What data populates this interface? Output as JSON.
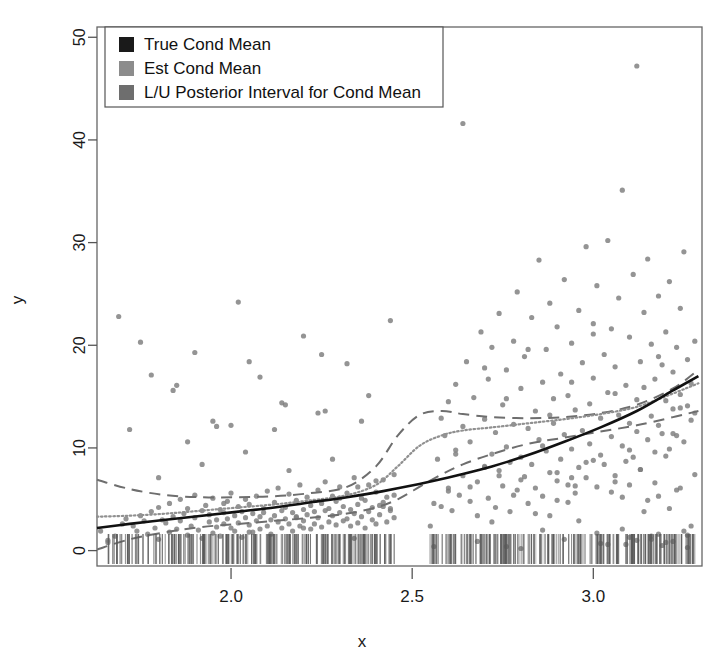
{
  "chart_data": {
    "type": "scatter",
    "title": "",
    "xlabel": "x",
    "ylabel": "y",
    "xlim": [
      1.63,
      3.3
    ],
    "ylim": [
      -1.5,
      51.0
    ],
    "grid": false,
    "xticks": [
      2.0,
      2.5,
      3.0
    ],
    "xticklabels": [
      "2.0",
      "2.5",
      "3.0"
    ],
    "yticks": [
      0,
      10,
      20,
      30,
      40,
      50
    ],
    "yticklabels": [
      "0",
      "10",
      "20",
      "30",
      "40",
      "50"
    ],
    "legend": {
      "position": "top-left",
      "entries": [
        {
          "label": "True Cond Mean",
          "color": "#1a1a1a",
          "marker": "square",
          "style": "solid"
        },
        {
          "label": "Est Cond Mean",
          "color": "#8c8c8c",
          "marker": "square",
          "style": "dotted"
        },
        {
          "label": "L/U Posterior Interval for Cond Mean",
          "color": "#6e6e6e",
          "marker": "square",
          "style": "dashed"
        }
      ]
    },
    "series": [
      {
        "name": "True Cond Mean",
        "type": "line",
        "style": "solid",
        "color": "#111111",
        "width": 2.6,
        "x": [
          1.63,
          1.72,
          1.82,
          1.92,
          2.02,
          2.12,
          2.22,
          2.32,
          2.42,
          2.52,
          2.62,
          2.72,
          2.82,
          2.92,
          3.02,
          3.12,
          3.22,
          3.29
        ],
        "y": [
          2.2,
          2.6,
          3.0,
          3.4,
          3.8,
          4.2,
          4.7,
          5.2,
          5.8,
          6.5,
          7.3,
          8.2,
          9.3,
          10.6,
          12.0,
          13.6,
          15.6,
          17.0
        ]
      },
      {
        "name": "Est Cond Mean",
        "type": "line",
        "style": "dotted",
        "color": "#909090",
        "width": 2.2,
        "x": [
          1.63,
          1.72,
          1.82,
          1.92,
          2.02,
          2.12,
          2.22,
          2.32,
          2.4,
          2.46,
          2.52,
          2.58,
          2.64,
          2.72,
          2.82,
          2.92,
          3.02,
          3.12,
          3.22,
          3.29
        ],
        "y": [
          3.3,
          3.4,
          3.6,
          3.9,
          4.2,
          4.5,
          4.9,
          5.4,
          6.4,
          8.2,
          10.2,
          11.2,
          11.7,
          12.0,
          12.4,
          12.8,
          13.3,
          14.0,
          15.3,
          16.3
        ]
      },
      {
        "name": "Upper Posterior Interval",
        "type": "line",
        "style": "dashed",
        "color": "#6e6e6e",
        "width": 2.0,
        "x": [
          1.63,
          1.72,
          1.82,
          1.92,
          2.02,
          2.12,
          2.22,
          2.32,
          2.4,
          2.46,
          2.52,
          2.58,
          2.64,
          2.72,
          2.82,
          2.92,
          3.02,
          3.12,
          3.22,
          3.29
        ],
        "y": [
          6.9,
          6.0,
          5.4,
          5.2,
          5.2,
          5.3,
          5.6,
          6.2,
          8.2,
          11.2,
          13.2,
          13.6,
          13.3,
          13.0,
          12.9,
          13.0,
          13.4,
          14.2,
          15.8,
          17.6
        ]
      },
      {
        "name": "Lower Posterior Interval",
        "type": "line",
        "style": "dashed",
        "color": "#6e6e6e",
        "width": 2.0,
        "x": [
          1.63,
          1.72,
          1.82,
          1.92,
          2.02,
          2.12,
          2.22,
          2.32,
          2.4,
          2.46,
          2.52,
          2.58,
          2.64,
          2.72,
          2.82,
          2.92,
          3.02,
          3.12,
          3.22,
          3.29
        ],
        "y": [
          0.1,
          1.1,
          1.8,
          2.3,
          2.6,
          2.9,
          3.2,
          3.6,
          4.2,
          5.0,
          6.2,
          7.4,
          8.4,
          9.4,
          10.4,
          11.0,
          11.6,
          12.2,
          13.0,
          13.6
        ]
      }
    ],
    "points": {
      "name": "observations",
      "marker": "circle",
      "color": "#7d7d7d",
      "size": 5,
      "n": 420,
      "x": [
        1.64,
        1.66,
        1.68,
        1.7,
        1.71,
        1.73,
        1.74,
        1.75,
        1.76,
        1.77,
        1.78,
        1.79,
        1.8,
        1.8,
        1.81,
        1.82,
        1.83,
        1.83,
        1.84,
        1.85,
        1.86,
        1.86,
        1.87,
        1.88,
        1.88,
        1.89,
        1.9,
        1.9,
        1.91,
        1.92,
        1.92,
        1.93,
        1.94,
        1.94,
        1.95,
        1.95,
        1.96,
        1.96,
        1.97,
        1.97,
        1.98,
        1.98,
        1.99,
        1.99,
        2.0,
        2.0,
        2.01,
        2.01,
        2.02,
        2.02,
        2.03,
        2.03,
        2.04,
        2.04,
        2.05,
        2.05,
        2.06,
        2.06,
        2.07,
        2.07,
        2.08,
        2.08,
        2.09,
        2.09,
        2.1,
        2.1,
        2.11,
        2.11,
        2.12,
        2.12,
        2.13,
        2.13,
        2.14,
        2.14,
        2.15,
        2.15,
        2.16,
        2.16,
        2.17,
        2.17,
        2.18,
        2.18,
        2.19,
        2.19,
        2.2,
        2.2,
        2.21,
        2.21,
        2.22,
        2.22,
        2.23,
        2.23,
        2.24,
        2.24,
        2.25,
        2.25,
        2.26,
        2.26,
        2.27,
        2.27,
        2.28,
        2.28,
        2.29,
        2.29,
        2.3,
        2.3,
        2.31,
        2.31,
        2.32,
        2.32,
        2.33,
        2.33,
        2.34,
        2.34,
        2.35,
        2.35,
        2.36,
        2.36,
        2.37,
        2.37,
        2.38,
        2.38,
        2.39,
        2.39,
        2.4,
        2.4,
        2.41,
        2.41,
        2.42,
        2.42,
        2.43,
        2.43,
        2.44,
        2.44,
        2.45,
        2.45,
        2.55,
        2.56,
        2.57,
        2.58,
        2.59,
        2.6,
        2.6,
        2.61,
        2.62,
        2.62,
        2.63,
        2.64,
        2.64,
        2.65,
        2.66,
        2.66,
        2.67,
        2.68,
        2.68,
        2.69,
        2.7,
        2.7,
        2.71,
        2.71,
        2.72,
        2.72,
        2.73,
        2.73,
        2.74,
        2.74,
        2.75,
        2.75,
        2.76,
        2.76,
        2.77,
        2.77,
        2.78,
        2.78,
        2.79,
        2.79,
        2.8,
        2.8,
        2.81,
        2.81,
        2.82,
        2.82,
        2.83,
        2.83,
        2.84,
        2.84,
        2.85,
        2.85,
        2.86,
        2.86,
        2.87,
        2.87,
        2.88,
        2.88,
        2.89,
        2.89,
        2.9,
        2.9,
        2.91,
        2.91,
        2.92,
        2.92,
        2.93,
        2.93,
        2.94,
        2.94,
        2.95,
        2.95,
        2.96,
        2.96,
        2.97,
        2.97,
        2.98,
        2.98,
        2.99,
        2.99,
        3.0,
        3.0,
        3.01,
        3.01,
        3.02,
        3.02,
        3.03,
        3.03,
        3.04,
        3.04,
        3.05,
        3.05,
        3.06,
        3.06,
        3.07,
        3.07,
        3.08,
        3.08,
        3.09,
        3.09,
        3.1,
        3.1,
        3.11,
        3.11,
        3.12,
        3.12,
        3.13,
        3.13,
        3.14,
        3.14,
        3.15,
        3.15,
        3.16,
        3.16,
        3.17,
        3.17,
        3.18,
        3.18,
        3.19,
        3.19,
        3.2,
        3.2,
        3.21,
        3.21,
        3.22,
        3.22,
        3.23,
        3.23,
        3.24,
        3.24,
        3.25,
        3.25,
        3.26,
        3.26,
        3.27,
        3.27,
        3.28,
        3.28,
        1.69,
        1.72,
        1.78,
        1.84,
        1.9,
        1.96,
        2.02,
        2.08,
        2.14,
        2.2,
        2.26,
        2.32,
        2.38,
        2.44,
        2.58,
        2.64,
        2.7,
        2.76,
        2.82,
        2.88,
        2.94,
        3.0,
        3.06,
        3.12,
        3.18,
        3.24,
        1.75,
        1.85,
        1.95,
        2.05,
        2.15,
        2.25,
        2.35,
        2.45,
        2.6,
        2.7,
        2.8,
        2.9,
        3.0,
        3.1,
        3.2,
        1.8,
        1.92,
        2.04,
        2.16,
        2.28,
        2.4,
        2.62,
        2.74,
        2.86,
        2.98,
        3.1,
        3.22,
        1.88,
        2.0,
        2.12,
        2.24,
        2.36,
        2.56,
        2.68,
        2.8,
        2.92,
        3.04,
        3.16,
        3.26,
        1.66,
        1.98,
        2.18,
        2.3,
        2.42,
        2.66,
        2.78,
        2.94,
        3.08,
        3.18,
        3.27,
        2.05,
        2.2,
        2.34,
        2.72,
        2.84,
        2.96,
        3.14,
        3.21,
        2.88,
        3.02,
        3.1,
        3.19,
        3.25,
        2.76,
        2.9,
        3.05,
        3.15,
        2.95,
        3.08,
        3.17,
        3.23,
        2.86,
        3.12,
        3.2,
        3.26,
        3.09,
        3.13,
        3.24,
        3.28,
        3.06,
        3.18,
        2.93,
        3.01,
        3.16,
        3.22
      ],
      "y": [
        1.9,
        1.0,
        1.4,
        2.6,
        3.1,
        2.4,
        1.9,
        3.4,
        2.9,
        1.6,
        3.8,
        2.2,
        4.2,
        1.1,
        3.0,
        2.7,
        4.6,
        1.8,
        3.3,
        2.1,
        5.0,
        2.9,
        3.6,
        1.5,
        4.1,
        2.4,
        3.2,
        5.4,
        2.0,
        3.9,
        1.2,
        4.4,
        2.8,
        3.5,
        1.7,
        5.1,
        3.0,
        2.3,
        4.0,
        1.4,
        3.7,
        2.6,
        4.8,
        3.1,
        2.2,
        5.6,
        3.4,
        1.9,
        4.3,
        2.7,
        3.8,
        1.3,
        5.0,
        3.2,
        2.5,
        4.5,
        3.6,
        1.8,
        2.9,
        5.3,
        3.3,
        2.1,
        4.1,
        3.7,
        2.4,
        5.8,
        3.0,
        1.6,
        4.7,
        3.4,
        2.8,
        6.1,
        3.9,
        2.2,
        4.2,
        3.1,
        5.5,
        2.6,
        3.7,
        1.9,
        4.9,
        3.3,
        2.4,
        6.4,
        4.0,
        2.9,
        3.5,
        5.2,
        2.1,
        4.4,
        3.8,
        2.6,
        5.9,
        3.2,
        4.6,
        2.3,
        3.9,
        6.7,
        4.1,
        2.8,
        5.3,
        3.4,
        2.5,
        4.8,
        3.7,
        6.2,
        2.9,
        4.3,
        3.1,
        5.6,
        2.4,
        4.0,
        3.6,
        7.1,
        4.5,
        2.7,
        5.1,
        3.3,
        4.9,
        2.2,
        3.8,
        6.4,
        4.2,
        3.0,
        5.7,
        2.6,
        4.4,
        3.5,
        6.9,
        4.7,
        2.8,
        5.2,
        3.9,
        4.1,
        3.2,
        5.4,
        2.4,
        4.6,
        8.9,
        4.3,
        11.2,
        6.1,
        14.5,
        3.9,
        9.8,
        16.2,
        5.4,
        12.1,
        7.3,
        18.4,
        4.8,
        10.6,
        14.9,
        6.7,
        3.4,
        21.3,
        8.2,
        12.8,
        5.1,
        16.7,
        9.4,
        19.8,
        4.2,
        11.5,
        7.8,
        23.1,
        6.3,
        14.2,
        10.1,
        17.6,
        3.8,
        8.6,
        20.4,
        12.3,
        5.9,
        25.2,
        9.1,
        15.8,
        7.2,
        18.9,
        4.6,
        11.9,
        22.7,
        8.4,
        13.6,
        6.1,
        28.3,
        10.8,
        16.4,
        5.3,
        19.6,
        9.7,
        24.1,
        7.6,
        12.4,
        14.8,
        4.9,
        21.8,
        8.9,
        17.2,
        11.3,
        26.4,
        6.4,
        15.1,
        9.9,
        20.2,
        13.7,
        5.6,
        23.4,
        8.1,
        18.3,
        11.7,
        29.6,
        7.1,
        14.3,
        10.4,
        22.1,
        16.8,
        6.2,
        25.8,
        9.3,
        12.9,
        19.1,
        8.4,
        30.2,
        15.4,
        11.1,
        21.6,
        7.3,
        17.9,
        13.2,
        24.6,
        10.2,
        35.1,
        8.7,
        16.1,
        12.4,
        20.8,
        9.1,
        26.9,
        14.7,
        11.6,
        18.4,
        7.9,
        23.2,
        15.9,
        10.8,
        28.4,
        13.1,
        20.1,
        9.6,
        16.7,
        12.2,
        24.8,
        18.1,
        11.4,
        14.6,
        21.3,
        9.9,
        26.2,
        13.8,
        17.4,
        11.2,
        19.8,
        15.2,
        23.6,
        10.6,
        29.1,
        14.1,
        18.6,
        12.7,
        16.3,
        20.4,
        13.4,
        22.8,
        11.8,
        17.1,
        15.6,
        19.3,
        12.1,
        24.2,
        16.9,
        14.4,
        20.9,
        13.6,
        18.2,
        15.1,
        22.4,
        12.9,
        41.6,
        17.8,
        14.8,
        19.6,
        13.2,
        16.4,
        21.1,
        15.3,
        47.2,
        18.9,
        13.9,
        20.3,
        16.1,
        12.6,
        18.4,
        14.2,
        19.1,
        6.2,
        7.4,
        5.8,
        8.1,
        6.9,
        7.6,
        8.8,
        6.4,
        9.2,
        7.1,
        8.4,
        9.6,
        7.8,
        8.9,
        6.8,
        9.4,
        7.3,
        10.2,
        8.6,
        9.8,
        11.4,
        10.6,
        12.2,
        11.8,
        13.4,
        12.6,
        0.4,
        0.9,
        0.2,
        1.1,
        0.6,
        1.4,
        0.3,
        0.8,
        4.6,
        3.2,
        5.1,
        4.3,
        6.2,
        5.4,
        7.1,
        2.1,
        1.6,
        2.4,
        1.8,
        2.2,
        1.2,
        2.8,
        3.6,
        2.9,
        3.8,
        4.1,
        3.4,
        0.7,
        1.3,
        0.5,
        1.9,
        0.4,
        6.8,
        5.7,
        4.9,
        6.3,
        5.2,
        6.6,
        5.9,
        2.0,
        1.0,
        0.8,
        1.5,
        0.6,
        7.9,
        6.1,
        7.4,
        6.7,
        5.3,
        4.7,
        1.7,
        1.1,
        0.9,
        8.2,
        7.6,
        8.8,
        7.2,
        6.4,
        9.1,
        8.4,
        9.6,
        8.1,
        10.4,
        9.2,
        11.1,
        10.8,
        8.6,
        9.9,
        10.2,
        12.1,
        11.6,
        10.9,
        9.4,
        13.2,
        12.8,
        11.3,
        10.1,
        14.6,
        12.4,
        13.9,
        11.9,
        10.7,
        12.2
      ]
    },
    "rug": {
      "name": "x-value-rug",
      "color": "#5a5a5a",
      "gap_range": [
        2.455,
        2.545
      ]
    }
  }
}
